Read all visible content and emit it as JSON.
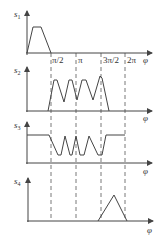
{
  "diagram": {
    "type": "timing-diagram",
    "x_axis_symbol": "φ",
    "ticks": [
      "π/2",
      "π",
      "3π/2",
      "2π"
    ],
    "signals": [
      {
        "name": "s",
        "sub": "1",
        "description": "single trapezoid pulse before π/2"
      },
      {
        "name": "s",
        "sub": "2",
        "description": "oscillating waveform between π/2 and 3π/2"
      },
      {
        "name": "s",
        "sub": "3",
        "description": "high level, oscillating dips between π/2 and 3π/2, high again until 2π"
      },
      {
        "name": "s",
        "sub": "4",
        "description": "triangle pulse between 3π/2 and 2π"
      }
    ]
  }
}
